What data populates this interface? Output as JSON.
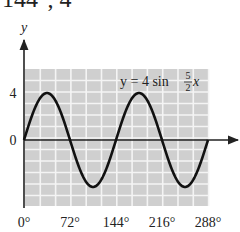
{
  "header_fragment": "144°, 4",
  "chart_data": {
    "type": "line",
    "title": "",
    "xlabel": "",
    "ylabel": "y",
    "equation": {
      "lhs": "y = 4 sin",
      "num": "5",
      "den": "2",
      "var": "x"
    },
    "x_ticks": [
      0,
      72,
      144,
      216,
      288
    ],
    "x_tick_labels": [
      "0°",
      "72°",
      "144°",
      "216°",
      "288°"
    ],
    "y_ticks": [
      0,
      4
    ],
    "y_tick_labels": [
      "0",
      "4"
    ],
    "xlim": [
      0,
      288
    ],
    "ylim": [
      -5.5,
      5.5
    ],
    "grid": true,
    "series": [
      {
        "name": "y = 4 sin(5x/2)",
        "function": "4*sin(2.5*x_deg)",
        "amplitude": 4,
        "frequency": 2.5,
        "x_degrees": [
          0,
          18,
          36,
          54,
          72,
          90,
          108,
          126,
          144,
          162,
          180,
          198,
          216,
          234,
          252,
          270,
          288
        ],
        "values": [
          0,
          2.83,
          4,
          2.83,
          0,
          -2.83,
          -4,
          -2.83,
          0,
          2.83,
          4,
          2.83,
          0,
          -2.83,
          -4,
          -2.83,
          0
        ]
      }
    ]
  },
  "colors": {
    "grid_bg": "#cfcfcf",
    "grid_line": "#f4f4f4",
    "curve": "#111111",
    "axis": "#222222"
  }
}
